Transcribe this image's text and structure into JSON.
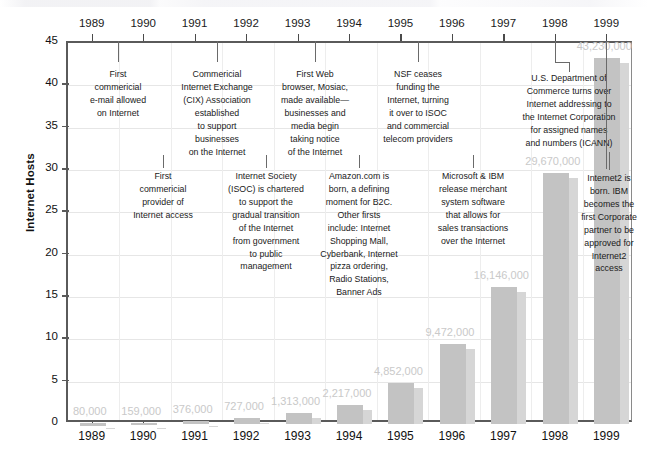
{
  "chart_data": {
    "type": "bar",
    "title": "",
    "subtitle": "",
    "xlabel": "",
    "ylabel": "Internet Hosts",
    "ylim": [
      0,
      45
    ],
    "ytick_step": 5,
    "grid": true,
    "legend": "none",
    "y_unit_note": "millions of hosts",
    "categories": [
      "1989",
      "1990",
      "1991",
      "1992",
      "1993",
      "1994",
      "1995",
      "1996",
      "1997",
      "1998",
      "1999"
    ],
    "yticks": [
      "0",
      "5",
      "10",
      "15",
      "20",
      "25",
      "30",
      "35",
      "40",
      "45"
    ],
    "values": [
      0.08,
      0.159,
      0.376,
      0.727,
      1.313,
      2.217,
      4.852,
      9.472,
      16.146,
      29.67,
      43.23
    ],
    "data_labels": [
      "80,000",
      "159,000",
      "376,000",
      "727,000",
      "1,313,000",
      "2,217,000",
      "4,852,000",
      "9,472,000",
      "16,146,000",
      "29,670,000",
      "43,230,000"
    ],
    "bar_color": "#c3c3c3",
    "bar_shadow_color": "#d6d6d6",
    "data_label_color": "#c9c9c9",
    "axis_color": "#5a5a5a",
    "grid_color": "#e6e6e6",
    "annotations": [
      {
        "year": "1989",
        "row": "top",
        "text": "First commericial e-mail allowed on Internet",
        "lines": [
          "First",
          "commericial",
          "e-mail allowed",
          "on Internet"
        ]
      },
      {
        "year": "1990",
        "row": "bottom",
        "text": "First commericial provider of Internet access",
        "lines": [
          "First",
          "commericial",
          "provider of",
          "Internet access"
        ]
      },
      {
        "year": "1991",
        "row": "top",
        "text": "Commericial Internet Exchange (CIX) Association established to support businesses on the Internet",
        "lines": [
          "Commericial",
          "Internet Exchange",
          "(CIX) Association",
          "established",
          "to support",
          "businesses",
          "on the Internet"
        ]
      },
      {
        "year": "1992",
        "row": "bottom",
        "text": "Internet Society (ISOC) is chartered to support the gradual transition of the Internet from government to public management",
        "lines": [
          "Internet Society",
          "(ISOC) is chartered",
          "to support the",
          "gradual transition",
          "of the Internet",
          "from government",
          "to public",
          "management"
        ]
      },
      {
        "year": "1993",
        "row": "top",
        "text": "First Web browser, Mosiac, made available—businesses and media begin taking notice of the Internet",
        "lines": [
          "First Web",
          "browser, Mosiac,",
          "made available—",
          "businesses and",
          "media begin",
          "taking notice",
          "of the Internet"
        ]
      },
      {
        "year": "1994",
        "row": "bottom",
        "text": "Amazon.com is born, a defining moment for B2C. Other firsts include: Internet Shopping Mall, Cyberbank, Internet pizza ordering, Radio Stations, Banner Ads",
        "lines": [
          "Amazon.com is",
          "born, a defining",
          "moment for B2C.",
          "Other firsts",
          "include: Internet",
          "Shopping Mall,",
          "Cyberbank, Internet",
          "pizza ordering,",
          "Radio Stations,",
          "Banner Ads"
        ]
      },
      {
        "year": "1995",
        "row": "top",
        "text": "NSF ceases funding the Internet, turning it over to ISOC and commercial telecom providers",
        "lines": [
          "NSF ceases",
          "funding the",
          "Internet, turning",
          "it over to ISOC",
          "and commercial",
          "telecom providers"
        ]
      },
      {
        "year": "1996",
        "row": "bottom",
        "text": "Microsoft & IBM release merchant system software that allows for sales transactions over the Internet",
        "lines": [
          "Microsoft & IBM",
          "release merchant",
          "system software",
          "that allows for",
          "sales transactions",
          "over the Internet"
        ]
      },
      {
        "year": "1998",
        "row": "top",
        "text": "U.S. Department of Commerce turns over Internet addressing to the Internet Corporation for assigned names and numbers (ICANN)",
        "lines": [
          "U.S. Department of",
          "Commerce turns over",
          "Internet addressing to",
          "the Internet Corporation",
          "for assigned names",
          "and numbers (ICANN)"
        ]
      },
      {
        "year": "1999",
        "row": "bottom",
        "text": "Internet2 is born. IBM becomes the first Corporate partner to be approved for Internet2 access",
        "lines": [
          "Internet2 is",
          "born. IBM",
          "becomes the",
          "first Corporate",
          "partner to be",
          "approved for",
          "Internet2",
          "access"
        ]
      }
    ]
  }
}
